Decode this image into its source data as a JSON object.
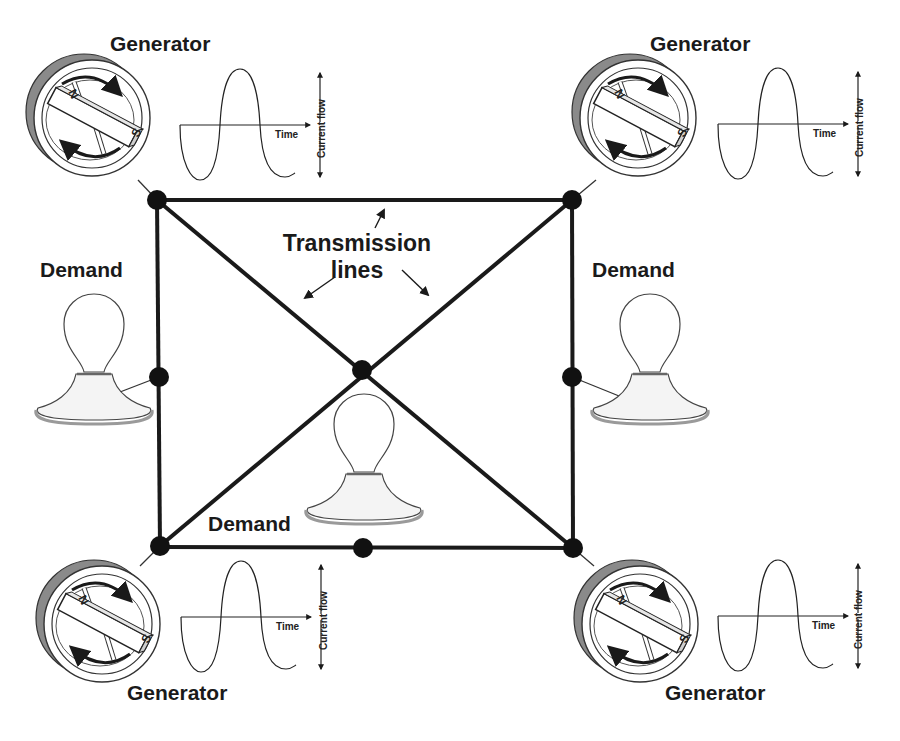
{
  "diagram": {
    "type": "power-grid-schematic",
    "generators": [
      {
        "id": "top-left",
        "label": "Generator",
        "magnet_n": "N",
        "magnet_s": "S",
        "wave_x_label": "Time",
        "wave_y_label": "Current flow"
      },
      {
        "id": "top-right",
        "label": "Generator",
        "magnet_n": "N",
        "magnet_s": "S",
        "wave_x_label": "Time",
        "wave_y_label": "Current flow"
      },
      {
        "id": "bottom-left",
        "label": "Generator",
        "magnet_n": "N",
        "magnet_s": "S",
        "wave_x_label": "Time",
        "wave_y_label": "Current flow"
      },
      {
        "id": "bottom-right",
        "label": "Generator",
        "magnet_n": "N",
        "magnet_s": "S",
        "wave_x_label": "Time",
        "wave_y_label": "Current flow"
      }
    ],
    "demands": [
      {
        "id": "left",
        "label": "Demand"
      },
      {
        "id": "right",
        "label": "Demand"
      },
      {
        "id": "center",
        "label": "Demand"
      }
    ],
    "transmission": {
      "label_line1": "Transmission",
      "label_line2": "lines"
    },
    "nodes": [
      {
        "id": "tl",
        "x": 157,
        "y": 200
      },
      {
        "id": "tr",
        "x": 572,
        "y": 200
      },
      {
        "id": "bl",
        "x": 160,
        "y": 546
      },
      {
        "id": "br",
        "x": 573,
        "y": 548
      },
      {
        "id": "center",
        "x": 362,
        "y": 370
      },
      {
        "id": "left-mid",
        "x": 159,
        "y": 377
      },
      {
        "id": "right-mid",
        "x": 572,
        "y": 377
      },
      {
        "id": "bottom-mid",
        "x": 363,
        "y": 548
      }
    ],
    "colors": {
      "line": "#1a1a1a",
      "node": "#111111",
      "generator_shadow": "#8a8a8a",
      "base_rim": "#9a9a9a",
      "background": "#ffffff"
    }
  }
}
